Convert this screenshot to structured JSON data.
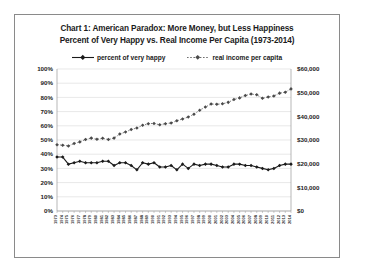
{
  "chart_frame": {
    "border_color": "#8a8a8a",
    "background": "#ffffff"
  },
  "title": {
    "line1": "Chart 1: American Paradox: More Money, but Less Happiness",
    "line2": "Percent of Very Happy vs. Real Income Per Capita (1973-2014)"
  },
  "legend": {
    "position": "top",
    "items": [
      {
        "label": "percent of very happy",
        "style": "solid",
        "marker": "diamond",
        "color": "#1a1a1a"
      },
      {
        "label": "real income per capita",
        "style": "dotted",
        "marker": "diamond",
        "color": "#6e6e6e"
      }
    ]
  },
  "chart_data": {
    "type": "line",
    "title": "Chart 1: American Paradox: More Money, but Less Happiness",
    "subtitle": "Percent of Very Happy vs. Real Income Per Capita (1973-2014)",
    "xlabel": "",
    "ylabel": "",
    "grid": true,
    "x": [
      1973,
      1974,
      1975,
      1976,
      1977,
      1978,
      1979,
      1980,
      1981,
      1982,
      1983,
      1984,
      1985,
      1986,
      1987,
      1988,
      1989,
      1990,
      1991,
      1992,
      1993,
      1994,
      1995,
      1996,
      1997,
      1998,
      1999,
      2000,
      2001,
      2002,
      2003,
      2004,
      2005,
      2006,
      2007,
      2008,
      2009,
      2010,
      2011,
      2012,
      2013,
      2014
    ],
    "categories": [
      "1973",
      "1974",
      "1975",
      "1976",
      "1977",
      "1978",
      "1979",
      "1980",
      "1981",
      "1982",
      "1983",
      "1984",
      "1985",
      "1986",
      "1987",
      "1988",
      "1989",
      "1990",
      "1991",
      "1992",
      "1993",
      "1994",
      "1995",
      "1996",
      "1997",
      "1998",
      "1999",
      "2000",
      "2001",
      "2002",
      "2003",
      "2004",
      "2005",
      "2006",
      "2007",
      "2008",
      "2009",
      "2010",
      "2011",
      "2012",
      "2013",
      "2014"
    ],
    "axes": {
      "left": {
        "label": "",
        "ylim": [
          0,
          100
        ],
        "tick_values": [
          0,
          10,
          20,
          30,
          40,
          50,
          60,
          70,
          80,
          90,
          100
        ],
        "tick_labels": [
          "0%",
          "10%",
          "20%",
          "30%",
          "40%",
          "50%",
          "60%",
          "70%",
          "80%",
          "90%",
          "100%"
        ],
        "series_ref": "percent of very happy"
      },
      "right": {
        "label": "",
        "ylim": [
          0,
          60000
        ],
        "tick_values": [
          0,
          10000,
          20000,
          30000,
          40000,
          50000,
          60000
        ],
        "tick_labels": [
          "$0",
          "$10,000",
          "$20,000",
          "$30,000",
          "$40,000",
          "$50,000",
          "$60,000"
        ],
        "series_ref": "real income per capita"
      }
    },
    "series": [
      {
        "name": "percent of very happy",
        "axis": "left",
        "unit": "%",
        "style": "solid",
        "marker": "diamond",
        "color": "#1a1a1a",
        "values": [
          38,
          38,
          33,
          34,
          35,
          34,
          34,
          34,
          35,
          35,
          32,
          34,
          34,
          32,
          29,
          34,
          33,
          34,
          31,
          31,
          32,
          29,
          33,
          30,
          33,
          32,
          33,
          33,
          32,
          31,
          31,
          33,
          33,
          32,
          32,
          31,
          30,
          29,
          30,
          32,
          33,
          33
        ]
      },
      {
        "name": "real income per capita",
        "axis": "right",
        "unit": "$",
        "style": "dotted",
        "marker": "diamond",
        "color": "#6e6e6e",
        "values": [
          28000,
          27800,
          27500,
          28500,
          29200,
          30200,
          30800,
          30300,
          30700,
          30200,
          30800,
          32500,
          33400,
          34400,
          35100,
          36200,
          36900,
          37000,
          36400,
          36900,
          37200,
          38100,
          38900,
          39700,
          40900,
          42600,
          43900,
          45200,
          45100,
          45300,
          45900,
          47100,
          47800,
          48800,
          49400,
          49100,
          47600,
          48200,
          48600,
          49800,
          50200,
          51600
        ]
      }
    ]
  }
}
